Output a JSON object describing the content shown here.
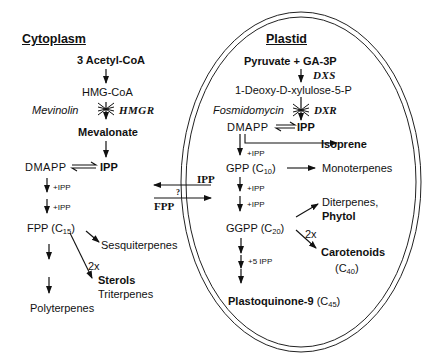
{
  "cytoplasm": {
    "header": "Cytoplasm",
    "acetyl": "3 Acetyl-CoA",
    "hmgcoa": "HMG-CoA",
    "inhibitor": "Mevinolin",
    "enzyme": "HMGR",
    "mevalonate": "Mevalonate",
    "dmapp": "DMAPP",
    "ipp": "IPP",
    "plus_ipp_1": "+IPP",
    "plus_ipp_2": "+IPP",
    "fpp": "FPP (C",
    "fpp_sub": "15",
    "fpp_close": ")",
    "sesquiterpenes": "Sesquiterpenes",
    "two_x": "2x",
    "sterols": "Sterols",
    "triterpenes": "Triterpenes",
    "polyterpenes": "Polyterpenes"
  },
  "exchange": {
    "ipp": "IPP",
    "question": "?",
    "fpp": "FPP"
  },
  "plastid": {
    "header": "Plastid",
    "substrates": "Pyruvate + GA-3P",
    "enzyme1": "DXS",
    "dxp": "1-Deoxy-D-xylulose-5-P",
    "inhibitor": "Fosmidomycin",
    "enzyme2": "DXR",
    "dmapp": "DMAPP",
    "ipp": "IPP",
    "isoprene": "Isoprene",
    "plus_ipp_1": "+IPP",
    "gpp": "GPP (C",
    "gpp_sub": "10",
    "gpp_close": ")",
    "monoterpenes": "Monoterpenes",
    "plus_ipp_2": "+IPP",
    "plus_ipp_3": "+IPP",
    "diterpenes": "Diterpenes,",
    "phytol": "Phytol",
    "ggpp": "GGPP (C",
    "ggpp_sub": "20",
    "ggpp_close": ")",
    "two_x": "2x",
    "carotenoids": "Carotenoids",
    "carotenoids_c": "(C",
    "carotenoids_sub": "40",
    "carotenoids_close": ")",
    "plus_5_ipp": "+5 IPP",
    "plastoquinone": "Plastoquinone-9",
    "plastoquinone_c": "(C",
    "plastoquinone_sub": "45",
    "plastoquinone_close": ")"
  }
}
